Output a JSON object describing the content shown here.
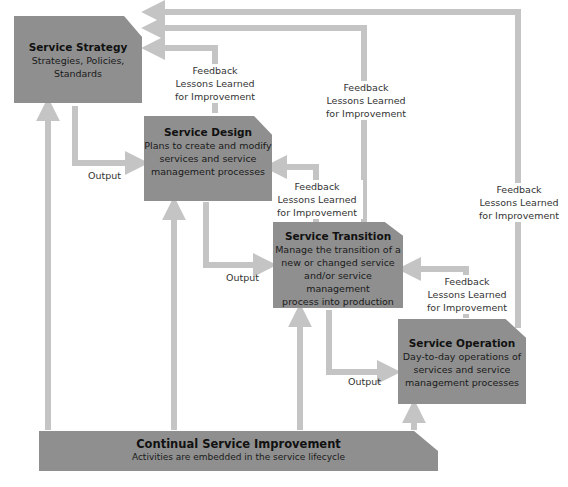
{
  "diagram": {
    "colors": {
      "box_fill": "#8f8f8f",
      "connector": "#c4c4c4",
      "text": "#1a1a1a"
    },
    "boxes": {
      "service_strategy": {
        "title": "Service Strategy",
        "desc": [
          "Strategies, Policies,",
          "Standards"
        ]
      },
      "service_design": {
        "title": "Service Design",
        "desc": [
          "Plans to create and modify",
          "services and service",
          "management processes"
        ]
      },
      "service_transition": {
        "title": "Service Transition",
        "desc": [
          "Manage the transition of a",
          "new or changed service",
          "and/or service management",
          "process into production"
        ]
      },
      "service_operation": {
        "title": "Service Operation",
        "desc": [
          "Day-to-day operations of",
          "services and service",
          "management processes"
        ]
      },
      "continual_service_improvement": {
        "title": "Continual Service Improvement",
        "desc": [
          "Activities are embedded in the service lifecycle"
        ]
      }
    },
    "labels": {
      "output": "Output",
      "feedback": [
        "Feedback",
        "Lessons Learned",
        "for Improvement"
      ]
    },
    "edges": [
      {
        "from": "Service Strategy",
        "to": "Service Design",
        "label": "Output"
      },
      {
        "from": "Service Design",
        "to": "Service Transition",
        "label": "Output"
      },
      {
        "from": "Service Transition",
        "to": "Service Operation",
        "label": "Output"
      },
      {
        "from": "Service Design",
        "to": "Service Strategy",
        "label": "Feedback Lessons Learned for Improvement"
      },
      {
        "from": "Service Transition",
        "to": "Service Strategy",
        "label": "Feedback Lessons Learned for Improvement"
      },
      {
        "from": "Service Operation",
        "to": "Service Strategy",
        "label": "Feedback Lessons Learned for Improvement"
      },
      {
        "from": "Service Transition",
        "to": "Service Design",
        "label": "Feedback Lessons Learned for Improvement"
      },
      {
        "from": "Service Operation",
        "to": "Service Transition",
        "label": "Feedback Lessons Learned for Improvement"
      },
      {
        "from": "Continual Service Improvement",
        "to": "Service Strategy",
        "label": ""
      },
      {
        "from": "Continual Service Improvement",
        "to": "Service Design",
        "label": ""
      },
      {
        "from": "Continual Service Improvement",
        "to": "Service Transition",
        "label": ""
      },
      {
        "from": "Continual Service Improvement",
        "to": "Service Operation",
        "label": ""
      }
    ]
  }
}
